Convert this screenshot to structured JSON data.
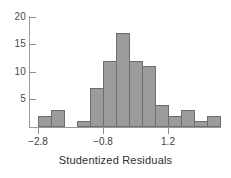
{
  "chart_data": {
    "type": "bar",
    "title": "",
    "subtitle": "",
    "xlabel": "Studentized Residuals",
    "ylabel": "",
    "grid": false,
    "legend": null,
    "xlim": [
      -3.0,
      3.2
    ],
    "ylim": [
      0,
      20
    ],
    "x_tick_labels": [
      "−2.8",
      "−0.8",
      "1.2"
    ],
    "x_tick_values": [
      -2.8,
      -0.8,
      1.2
    ],
    "y_tick_labels": [
      "5",
      "10",
      "15",
      "20"
    ],
    "y_tick_values": [
      5,
      10,
      15,
      20
    ],
    "bin_width": 0.4,
    "bin_edges": [
      -2.8,
      -2.4,
      -2.0,
      -1.6,
      -1.2,
      -0.8,
      -0.4,
      0.0,
      0.4,
      0.8,
      1.2,
      1.6,
      2.0,
      2.4,
      2.8,
      3.2
    ],
    "categories": [
      "-2.8 to -2.4",
      "-2.4 to -2.0",
      "-2.0 to -1.6",
      "-1.6 to -1.2",
      "-1.2 to -0.8",
      "-0.8 to -0.4",
      "-0.4 to 0.0",
      "0.0 to 0.4",
      "0.4 to 0.8",
      "0.8 to 1.2",
      "1.2 to 1.6",
      "1.6 to 2.0",
      "2.0 to 2.4",
      "2.4 to 2.8",
      "2.8 to 3.2"
    ],
    "values": [
      2,
      3,
      0,
      1,
      7,
      12,
      17,
      12,
      11,
      4,
      2,
      3,
      1,
      2,
      0
    ],
    "bar_color": "#9c9c9c",
    "bar_edge_color": "#6e6e6e",
    "axis_color": "#9a9a9a"
  },
  "axes": {
    "x_title": "Studentized Residuals",
    "y_ticks": [
      {
        "label": "20",
        "value": 20
      },
      {
        "label": "15",
        "value": 15
      },
      {
        "label": "10",
        "value": 10
      },
      {
        "label": "5",
        "value": 5
      }
    ],
    "x_ticks": [
      {
        "label": "−2.8",
        "value": -2.8
      },
      {
        "label": "−0.8",
        "value": -0.8
      },
      {
        "label": "1.2",
        "value": 1.2
      }
    ]
  }
}
